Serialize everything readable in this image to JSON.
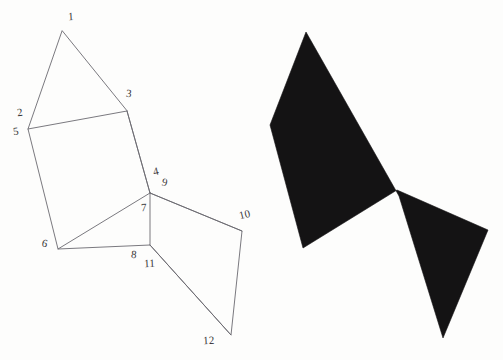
{
  "figure": {
    "canvas": {
      "width": 503,
      "height": 360,
      "background": "#fdfdfc"
    },
    "stroke_color": "#6b6a70",
    "fill_color": "#141314",
    "stroke_width": 0.9
  },
  "left_diagram": {
    "name": "outlined-polygon-with-vertex-numbers",
    "vertices": [
      {
        "id": "1",
        "label": "1",
        "x": 62,
        "y": 31,
        "label_x": 68,
        "label_y": 11,
        "style": "skew-e"
      },
      {
        "id": "2",
        "label": "2",
        "x": 28,
        "y": 129,
        "label_x": 17,
        "label_y": 107,
        "style": "skew-a"
      },
      {
        "id": "3",
        "label": "3",
        "x": 127,
        "y": 111,
        "label_x": 126,
        "label_y": 88,
        "style": "skew-b"
      },
      {
        "id": "4",
        "label": "4",
        "x": 150,
        "y": 193,
        "label_x": 153,
        "label_y": 166,
        "style": "skew-c"
      },
      {
        "id": "5",
        "label": "5",
        "x": 28,
        "y": 129,
        "label_x": 13,
        "label_y": 126,
        "style": "skew-a"
      },
      {
        "id": "6",
        "label": "6",
        "x": 58,
        "y": 249,
        "label_x": 42,
        "label_y": 238,
        "style": "skew-d"
      },
      {
        "id": "7",
        "label": "7",
        "x": 150,
        "y": 193,
        "label_x": 141,
        "label_y": 202,
        "style": "skew-e"
      },
      {
        "id": "8",
        "label": "8",
        "x": 150,
        "y": 245,
        "label_x": 131,
        "label_y": 249,
        "style": "skew-b"
      },
      {
        "id": "9",
        "label": "9",
        "x": 150,
        "y": 193,
        "label_x": 162,
        "label_y": 177,
        "style": "skew-d"
      },
      {
        "id": "10",
        "label": "10",
        "x": 242,
        "y": 231,
        "label_x": 239,
        "label_y": 209,
        "style": "skew-c"
      },
      {
        "id": "11",
        "label": "11",
        "x": 150,
        "y": 245,
        "label_x": 144,
        "label_y": 258,
        "style": "skew-e"
      },
      {
        "id": "12",
        "label": "12",
        "x": 231,
        "y": 335,
        "label_x": 203,
        "label_y": 335,
        "style": "skew-e"
      }
    ],
    "outline_path": "M 62 31 L 28 129 L 58 249 L 150 245 L 231 335 L 242 231 L 150 193 L 127 111 Z",
    "internal_edges": [
      {
        "name": "edge-2-3",
        "path": "M 28 129 L 127 111"
      },
      {
        "name": "edge-3-4",
        "path": "M 127 111 L 150 193"
      },
      {
        "name": "edge-6-4",
        "path": "M 58 249 L 150 193"
      },
      {
        "name": "edge-7-8",
        "path": "M 150 193 L 150 245"
      },
      {
        "name": "edge-9-10",
        "path": "M 150 193 L 242 231"
      },
      {
        "name": "edge-11-12",
        "path": "M 150 245 L 231 335"
      }
    ]
  },
  "right_silhouette": {
    "name": "filled-black-polygon",
    "path": "M 306 32 L 270 125 L 303 248 L 397 190 L 488 230 L 443 338 L 399 196 Z",
    "fill": "#141314"
  }
}
